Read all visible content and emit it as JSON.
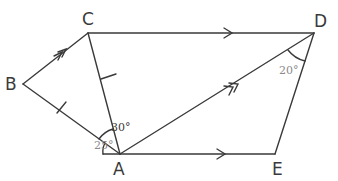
{
  "diagram": {
    "points": {
      "A": {
        "label": "A",
        "x": 120,
        "y": 154
      },
      "B": {
        "label": "B",
        "x": 23,
        "y": 84
      },
      "C": {
        "label": "C",
        "x": 88,
        "y": 33
      },
      "D": {
        "label": "D",
        "x": 314,
        "y": 33
      },
      "E": {
        "label": "E",
        "x": 275,
        "y": 154
      }
    },
    "segments": [
      "BC",
      "CD",
      "CA",
      "BA",
      "AD",
      "AE",
      "DE"
    ],
    "parallel_marks": {
      "single_arrow": [
        "CD",
        "AE"
      ],
      "double_arrow": [
        "BC",
        "AD"
      ]
    },
    "equal_marks": [
      "CA",
      "BA"
    ],
    "angles": [
      {
        "label": "30°",
        "at": "A",
        "between": [
          "B",
          "C"
        ],
        "color": "#3a3a3a"
      },
      {
        "label": "25°",
        "at": "A",
        "between": [
          "E-extension",
          "B"
        ],
        "color": "#8a8a8a"
      },
      {
        "label": "20°",
        "at": "D",
        "between": [
          "A",
          "E"
        ],
        "color": "#8a8a8a"
      }
    ],
    "colors": {
      "line": "#3a3a3a",
      "muted_label": "#8a8a8a"
    }
  }
}
